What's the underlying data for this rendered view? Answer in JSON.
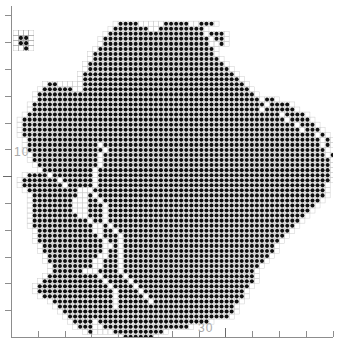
{
  "figure": {
    "type": "dot-density-grid-map",
    "background_color": "#ffffff",
    "dot_color": "#101010",
    "grid_line_color": "#c8c8c8",
    "axis_color": "#8d8d8d",
    "label_color": "#a9a9a9"
  },
  "axes": {
    "x": {
      "label_text": "30",
      "label_x_px": 208,
      "tick_count": 12,
      "tick_spacing_px": 26.8,
      "major_tick_index": 7
    },
    "y": {
      "label_text": "10",
      "label_y_px": 152,
      "tick_count": 12,
      "tick_spacing_px": 26.8,
      "major_tick_index": 5
    }
  },
  "inset": {
    "name": "detached-cluster-inset",
    "cols": 4,
    "rows": 4,
    "filled_cells": [
      [
        1,
        1
      ],
      [
        2,
        1
      ],
      [
        1,
        2
      ],
      [
        2,
        2
      ],
      [
        2,
        3
      ]
    ]
  },
  "chart_data": {
    "type": "heatmap",
    "title": "",
    "xlabel": "",
    "ylabel": "",
    "legend": [],
    "grid": true,
    "cell_size_px": 5.05,
    "cols": 64,
    "rows": 66,
    "xlim": [
      0,
      64
    ],
    "ylim": [
      0,
      66
    ],
    "note": "Binary occupancy grid: each row string has one character per column; '#' = filled dot, '.' = empty cell outside or inside hole.",
    "rows_data": [
      "................................................................",
      "................................................................",
      "................................................................",
      ".....................####.....#####..###........................",
      "....................#######..#########..........................",
      "...................###################.###......................",
      "..................#####################.##......................",
      "..................#####################..#......................",
      ".................#######################........................",
      "................########################........................",
      "................#########################.......................",
      "...............###########################......................",
      "...............############################.....................",
      "..............##############################....................",
      "..............###############################...................",
      ".......##.....################################..................",
      "......######..#################################.................",
      ".....###########################################................",
      ".....############################################.##............",
      "....##############################################.####.........",
      "....#############################################.######........",
      "...##################################################.####......",
      "..####################################################.####.....",
      "..######################################################.###....",
      "..#######################################################.###...",
      "..##########################################################.#..",
      "...##########################################################.#.",
      "...##############.###########################################.#.",
      "...###############.###########################################..",
      "....#############.############################################.#",
      "....#############.#############################################.",
      ".....############.#############################################.",
      "......##########.##############################################.",
      "...####.########.##############################################.",
      "..#######.######.##############################################.",
      "..########.#####.#############################################..",
      "...##########...##############################################..",
      "....#########..#.#############################################..",
      "....########...##.###########################################...",
      "....########...###.#########################################....",
      "....########...###.########################################.....",
      "....#########..###.#######################################......",
      "....###########.##.######################################.......",
      "....############..#.####################################........",
      ".....###########..##.##################################.........",
      ".....############.###.################################..........",
      ".....#############.##.###############################...........",
      "......############..#.##############################............",
      "......############.##.##############################............",
      ".......##########..##.#############################.............",
      ".......#########..###.############################..............",
      "........########..###.###########################...............",
      "........######...####.##########################................",
      ".......##########.####.#########################................",
      "......############.####.########################................",
      ".....##############.####.######################.................",
      ".....###############.####.####################..................",
      "......##############.#####.###################..................",
      "........############.######.#################...................",
      ".........###########.#######################....................",
      "..........##################################....................",
      "...........################################.....................",
      "............####.######################.........................",
      ".............###..#################.............................",
      "...............#....##########..................................",
      "......................######...................................."
    ]
  }
}
